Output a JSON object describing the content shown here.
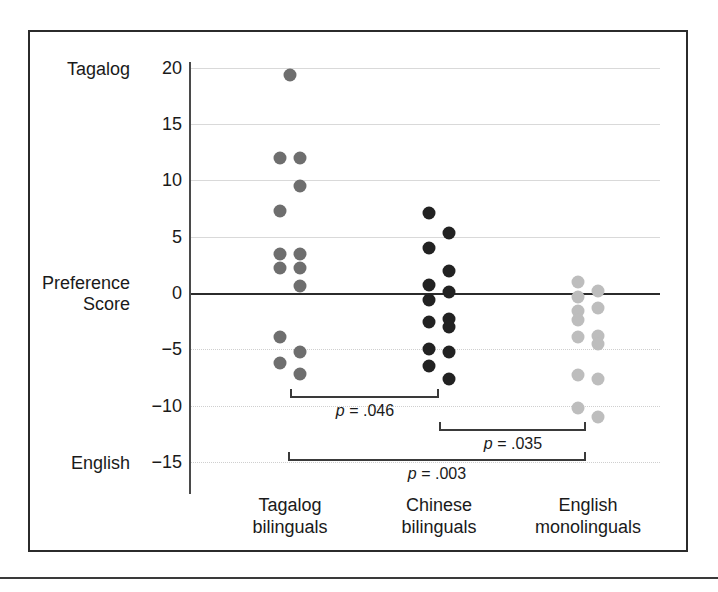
{
  "chart_data": {
    "type": "scatter",
    "title": "",
    "subtitle": "",
    "xlabel": "",
    "ylabel": "Preference Score",
    "ylabel_top": "Tagalog",
    "ylabel_bottom": "English",
    "ylim": [
      -15,
      20
    ],
    "grid": true,
    "legend": "none",
    "ytick_labels": [
      "20",
      "15",
      "10",
      "5",
      "0",
      "−5",
      "−10",
      "−15"
    ],
    "ytick_values": [
      20,
      15,
      10,
      5,
      0,
      -5,
      -10,
      -15
    ],
    "categories": [
      "Tagalog bilinguals",
      "Chinese bilinguals",
      "English monolinguals"
    ],
    "category_lines": [
      [
        "Tagalog",
        "bilinguals"
      ],
      [
        "Chinese",
        "bilinguals"
      ],
      [
        "English",
        "monolinguals"
      ]
    ],
    "series": [
      {
        "name": "Tagalog bilinguals",
        "color": "#6e6e6e",
        "points": [
          {
            "jitter": 0,
            "value": 19.4
          },
          {
            "jitter": -1,
            "value": 12.0
          },
          {
            "jitter": 1,
            "value": 12.0
          },
          {
            "jitter": 1,
            "value": 9.5
          },
          {
            "jitter": -1,
            "value": 7.3
          },
          {
            "jitter": -1,
            "value": 3.5
          },
          {
            "jitter": 1,
            "value": 3.5
          },
          {
            "jitter": -1,
            "value": 2.2
          },
          {
            "jitter": 1,
            "value": 2.2
          },
          {
            "jitter": 1,
            "value": 0.6
          },
          {
            "jitter": -1,
            "value": -3.9
          },
          {
            "jitter": 1,
            "value": -5.2
          },
          {
            "jitter": -1,
            "value": -6.2
          },
          {
            "jitter": 1,
            "value": -7.2
          }
        ]
      },
      {
        "name": "Chinese bilinguals",
        "color": "#222222",
        "points": [
          {
            "jitter": -1,
            "value": 7.1
          },
          {
            "jitter": 1,
            "value": 5.3
          },
          {
            "jitter": -1,
            "value": 4.0
          },
          {
            "jitter": 1,
            "value": 2.0
          },
          {
            "jitter": -1,
            "value": 0.7
          },
          {
            "jitter": 1,
            "value": 0.1
          },
          {
            "jitter": -1,
            "value": -0.6
          },
          {
            "jitter": -1,
            "value": -2.6
          },
          {
            "jitter": 1,
            "value": -2.3
          },
          {
            "jitter": 1,
            "value": -3.0
          },
          {
            "jitter": -1,
            "value": -5.0
          },
          {
            "jitter": 1,
            "value": -5.2
          },
          {
            "jitter": -1,
            "value": -6.5
          },
          {
            "jitter": 1,
            "value": -7.6
          }
        ]
      },
      {
        "name": "English monolinguals",
        "color": "#bdbdbd",
        "points": [
          {
            "jitter": -1,
            "value": 1.0
          },
          {
            "jitter": 1,
            "value": 0.2
          },
          {
            "jitter": -1,
            "value": -0.3
          },
          {
            "jitter": 1,
            "value": -1.3
          },
          {
            "jitter": -1,
            "value": -1.6
          },
          {
            "jitter": -1,
            "value": -2.4
          },
          {
            "jitter": 1,
            "value": -3.8
          },
          {
            "jitter": -1,
            "value": -3.9
          },
          {
            "jitter": 1,
            "value": -4.5
          },
          {
            "jitter": -1,
            "value": -7.3
          },
          {
            "jitter": 1,
            "value": -7.6
          },
          {
            "jitter": -1,
            "value": -10.2
          },
          {
            "jitter": 1,
            "value": -11.0
          }
        ]
      }
    ],
    "annotations": [
      {
        "id": "p1",
        "label_prefix": "p",
        "label_rest": " = .046",
        "from": "Tagalog bilinguals",
        "to": "Chinese bilinguals",
        "p_value": 0.046
      },
      {
        "id": "p2",
        "label_prefix": "p",
        "label_rest": " = .035",
        "from": "Chinese bilinguals",
        "to": "English monolinguals",
        "p_value": 0.035
      },
      {
        "id": "p3",
        "label_prefix": "p",
        "label_rest": " = .003",
        "from": "Tagalog bilinguals",
        "to": "English monolinguals",
        "p_value": 0.003
      }
    ]
  }
}
